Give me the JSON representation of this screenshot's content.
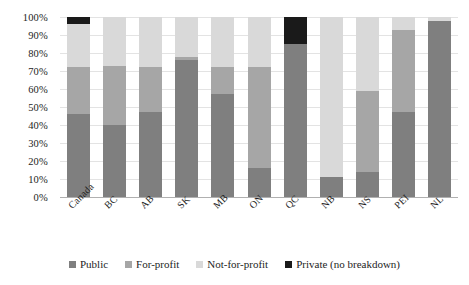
{
  "chart_data": {
    "type": "bar",
    "subtype": "stacked-bar-100-percent",
    "title": "",
    "xlabel": "",
    "ylabel": "",
    "ylim": [
      0,
      100
    ],
    "ytick_labels": [
      "100%",
      "90%",
      "80%",
      "70%",
      "60%",
      "50%",
      "40%",
      "30%",
      "20%",
      "10%",
      "0%"
    ],
    "ytick_values": [
      100,
      90,
      80,
      70,
      60,
      50,
      40,
      30,
      20,
      10,
      0
    ],
    "grid": true,
    "legend_position": "bottom",
    "categories": [
      "Canada",
      "BC",
      "AB",
      "SK",
      "MB",
      "ON",
      "QC",
      "NB",
      "NS",
      "PEI",
      "NL"
    ],
    "series": [
      {
        "name": "Public",
        "color": "#7f7f7f",
        "values": [
          46,
          40,
          47,
          76,
          57,
          16,
          85,
          11,
          14,
          47,
          98
        ]
      },
      {
        "name": "For-profit",
        "color": "#a6a6a6",
        "values": [
          26,
          33,
          25,
          2,
          15,
          56,
          0,
          0,
          45,
          46,
          0
        ]
      },
      {
        "name": "Not-for-profit",
        "color": "#d9d9d9",
        "values": [
          24,
          27,
          28,
          22,
          28,
          28,
          0,
          89,
          41,
          7,
          2
        ]
      },
      {
        "name": "Private (no breakdown)",
        "color": "#1a1a1a",
        "values": [
          4,
          0,
          0,
          0,
          0,
          0,
          15,
          0,
          0,
          0,
          0
        ]
      }
    ]
  },
  "legend": {
    "items": [
      {
        "label": "Public",
        "color": "#7f7f7f"
      },
      {
        "label": "For-profit",
        "color": "#a6a6a6"
      },
      {
        "label": "Not-for-profit",
        "color": "#d9d9d9"
      },
      {
        "label": "Private (no breakdown)",
        "color": "#1a1a1a"
      }
    ]
  },
  "colors": {
    "public": "#7f7f7f",
    "for_profit": "#a6a6a6",
    "not_for_profit": "#d9d9d9",
    "private": "#1a1a1a",
    "gridline": "#e3e3e3",
    "axis": "#b0b0b0",
    "text": "#1d1d1d",
    "background": "#ffffff"
  }
}
